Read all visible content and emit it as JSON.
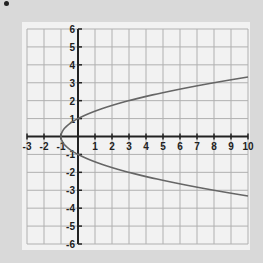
{
  "chart_data": {
    "type": "line",
    "title": "",
    "xlabel": "",
    "ylabel": "",
    "xlim": [
      -3,
      10
    ],
    "ylim": [
      -6,
      6
    ],
    "grid": true,
    "x_ticks": [
      "-3",
      "-2",
      "-1",
      "1",
      "2",
      "3",
      "4",
      "5",
      "6",
      "7",
      "8",
      "9",
      "10"
    ],
    "y_ticks": [
      "6",
      "5",
      "4",
      "3",
      "2",
      "1",
      "-1",
      "-2",
      "-3",
      "-4",
      "-5",
      "-6"
    ],
    "series": [
      {
        "name": "x = y^2 - 1",
        "points": [
          {
            "x": 10,
            "y": 3.32
          },
          {
            "x": 8,
            "y": 3
          },
          {
            "x": 3,
            "y": 2
          },
          {
            "x": 0,
            "y": 1
          },
          {
            "x": -1,
            "y": 0
          },
          {
            "x": 0,
            "y": -1
          },
          {
            "x": 3,
            "y": -2
          },
          {
            "x": 8,
            "y": -3
          },
          {
            "x": 10,
            "y": -3.32
          }
        ]
      }
    ],
    "colors": {
      "curve": "#666666",
      "grid": "#b0b0b0",
      "axis": "#222222",
      "background": "#f2f2f2"
    }
  }
}
